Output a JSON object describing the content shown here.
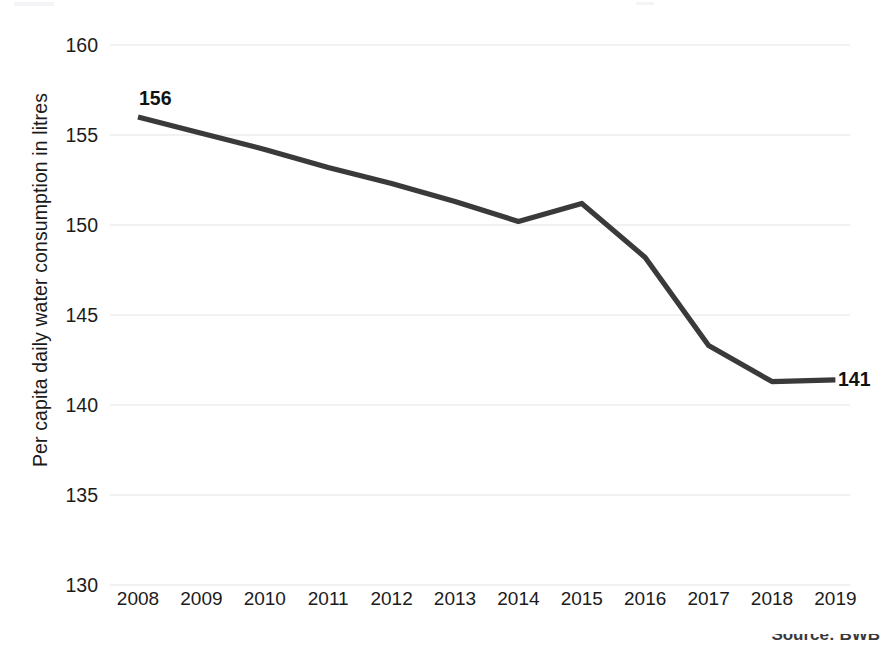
{
  "figure": {
    "background_color": "#ffffff",
    "line_color": "#3a3a3a",
    "gridline_color": "#e3e3e6",
    "text_color": "#1b1b1b",
    "cropped_footnote": "Source: BWB"
  },
  "chart_data": {
    "type": "line",
    "title": "",
    "subtitle": "",
    "xlabel": "",
    "ylabel": "Per capita daily water consumption in litres",
    "x": [
      "2008",
      "2009",
      "2010",
      "2011",
      "2012",
      "2013",
      "2014",
      "2015",
      "2016",
      "2017",
      "2018",
      "2019"
    ],
    "categories": [
      "2008",
      "2009",
      "2010",
      "2011",
      "2012",
      "2013",
      "2014",
      "2015",
      "2016",
      "2017",
      "2018",
      "2019"
    ],
    "values": [
      156.0,
      155.1,
      154.2,
      153.2,
      152.3,
      151.3,
      150.2,
      151.2,
      148.2,
      143.3,
      141.3,
      141.4
    ],
    "series": [
      {
        "name": "Per capita daily water consumption",
        "values": [
          156.0,
          155.1,
          154.2,
          153.2,
          152.3,
          151.3,
          150.2,
          151.2,
          148.2,
          143.3,
          141.3,
          141.4
        ]
      }
    ],
    "ylim": [
      130,
      160
    ],
    "yticks": [
      130,
      135,
      140,
      145,
      150,
      155,
      160
    ],
    "ytick_labels": [
      "130",
      "135",
      "140",
      "145",
      "150",
      "155",
      "160"
    ],
    "xtick_labels": [
      "2008",
      "2009",
      "2010",
      "2011",
      "2012",
      "2013",
      "2014",
      "2015",
      "2016",
      "2017",
      "2018",
      "2019"
    ],
    "grid": "horizontal",
    "legend": "none",
    "annotations": [
      {
        "label": "156",
        "x": "2008",
        "y": 156.0,
        "position": "above"
      },
      {
        "label": "141",
        "x": "2019",
        "y": 141.4,
        "position": "right"
      }
    ]
  }
}
